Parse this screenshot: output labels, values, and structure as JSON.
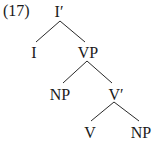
{
  "example_number": "(17)",
  "tree": {
    "nodes": [
      {
        "id": "Ibar",
        "label": "I′",
        "x": 59,
        "y": 16
      },
      {
        "id": "I",
        "label": "I",
        "x": 34,
        "y": 57
      },
      {
        "id": "VP",
        "label": "VP",
        "x": 88,
        "y": 57
      },
      {
        "id": "NP1",
        "label": "NP",
        "x": 60,
        "y": 99
      },
      {
        "id": "Vbar",
        "label": "V′",
        "x": 115,
        "y": 99
      },
      {
        "id": "V",
        "label": "V",
        "x": 90,
        "y": 137
      },
      {
        "id": "NP2",
        "label": "NP",
        "x": 141,
        "y": 137
      }
    ],
    "edges": [
      {
        "from": "Ibar",
        "to": "I"
      },
      {
        "from": "Ibar",
        "to": "VP"
      },
      {
        "from": "VP",
        "to": "NP1"
      },
      {
        "from": "VP",
        "to": "Vbar"
      },
      {
        "from": "Vbar",
        "to": "V"
      },
      {
        "from": "Vbar",
        "to": "NP2"
      }
    ]
  }
}
